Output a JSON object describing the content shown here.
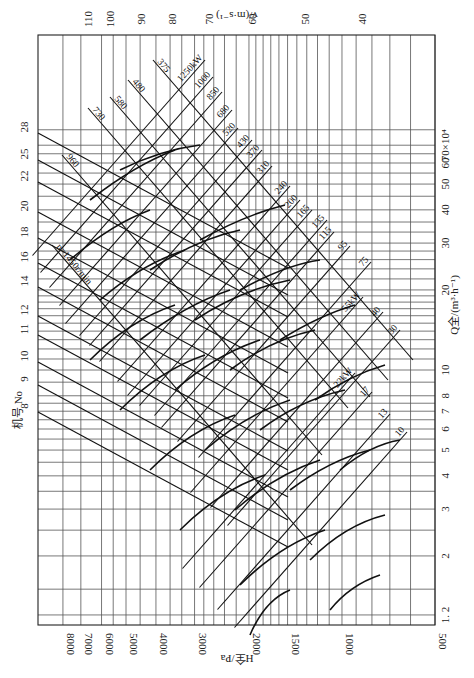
{
  "chart_data": {
    "type": "line",
    "orientation": "rotated-counterclockwise",
    "xaxis_bottom": {
      "label": "H全/Pa",
      "scale": "log",
      "range": [
        8500,
        500
      ],
      "ticks": [
        8000,
        7000,
        6000,
        5000,
        4000,
        3000,
        2000,
        1500,
        1000,
        500
      ]
    },
    "yaxis_right": {
      "label": "Q全/(m³·h⁻¹)",
      "scale": "log",
      "multiplier_label": "×10⁴",
      "range": [
        1.2,
        80
      ],
      "ticks": [
        "1. 2",
        "2",
        "3",
        "4",
        "5",
        "6",
        "7",
        "8",
        "10",
        "20",
        "30",
        "40",
        "50",
        "60",
        "70×10⁴"
      ],
      "tick_values": [
        1.2,
        2,
        3,
        4,
        5,
        6,
        7,
        8,
        10,
        20,
        30,
        40,
        50,
        60,
        70
      ]
    },
    "xaxis_top": {
      "label": "v/(m·s⁻¹)",
      "ticks": [
        110,
        100,
        90,
        80,
        70,
        60,
        50,
        40
      ]
    },
    "machine_numbers": {
      "label": "机号 No",
      "values": [
        8,
        9,
        10,
        11,
        12,
        14,
        16,
        18,
        20,
        22,
        25,
        28
      ]
    },
    "power_lines_kw": {
      "unit_label": "kW",
      "values": [
        1250,
        1000,
        850,
        680,
        520,
        430,
        370,
        310,
        240,
        200,
        165,
        135,
        115,
        95,
        75,
        55,
        40,
        30,
        22,
        17,
        13,
        10
      ],
      "labels": [
        "1250kW",
        "1000",
        "850",
        "680",
        "520",
        "430",
        "370",
        "310",
        "240",
        "200",
        "165",
        "135",
        "115",
        "95",
        "75",
        "55kW",
        "40",
        "30",
        "22kW",
        "17",
        "13",
        "10"
      ]
    },
    "speed_lines_rpm": {
      "values": [
        375,
        480,
        580,
        730,
        960,
        1450
      ],
      "labels": [
        "375",
        "480",
        "580",
        "730",
        "960",
        "n=1450r/min"
      ]
    },
    "grid": true
  }
}
